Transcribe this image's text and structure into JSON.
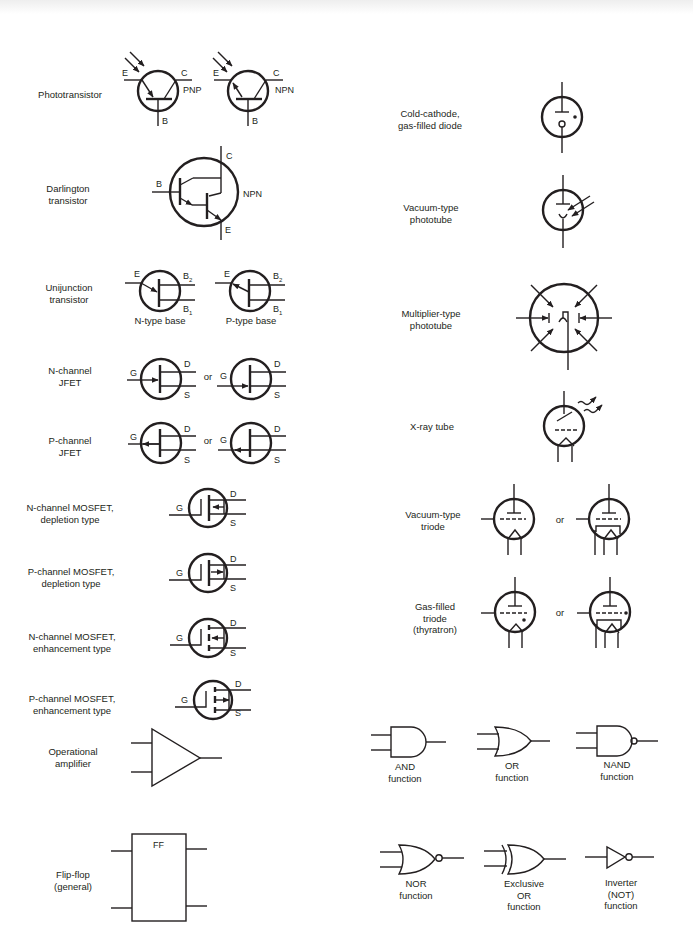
{
  "left_column": [
    {
      "id": "phototransistor",
      "label": "Phototransistor",
      "variants": [
        "PNP",
        "NPN"
      ],
      "pins": [
        "E",
        "C",
        "B"
      ]
    },
    {
      "id": "darlington",
      "label": "Darlington\ntransistor",
      "variants": [
        "NPN"
      ],
      "pins": [
        "B",
        "C",
        "E"
      ]
    },
    {
      "id": "ujt",
      "label": "Unijunction\ntransistor",
      "variants": [
        "N-type base",
        "P-type base"
      ],
      "pins": [
        "E",
        "B2",
        "B1"
      ]
    },
    {
      "id": "njfet",
      "label": "N-channel\nJFET",
      "pins": [
        "G",
        "D",
        "S"
      ],
      "or": "or"
    },
    {
      "id": "pjfet",
      "label": "P-channel\nJFET",
      "pins": [
        "G",
        "D",
        "S"
      ],
      "or": "or"
    },
    {
      "id": "nmos_dep",
      "label": "N-channel MOSFET,\ndepletion type",
      "pins": [
        "G",
        "D",
        "S"
      ]
    },
    {
      "id": "pmos_dep",
      "label": "P-channel MOSFET,\ndepletion type",
      "pins": [
        "G",
        "D",
        "S"
      ]
    },
    {
      "id": "nmos_enh",
      "label": "N-channel MOSFET,\nenhancement type",
      "pins": [
        "G",
        "D",
        "S"
      ]
    },
    {
      "id": "pmos_enh",
      "label": "P-channel MOSFET,\nenhancement type",
      "pins": [
        "G",
        "D",
        "S"
      ]
    },
    {
      "id": "opamp",
      "label": "Operational\namplifier"
    },
    {
      "id": "flipflop",
      "label": "Flip-flop\n(general)",
      "box_label": "FF"
    }
  ],
  "right_column": [
    {
      "id": "cold_cathode",
      "label": "Cold-cathode,\ngas-filled diode"
    },
    {
      "id": "vac_phototube",
      "label": "Vacuum-type\nphototube"
    },
    {
      "id": "mult_phototube",
      "label": "Multiplier-type\nphototube"
    },
    {
      "id": "xray",
      "label": "X-ray tube"
    },
    {
      "id": "vac_triode",
      "label": "Vacuum-type\ntriode",
      "or": "or"
    },
    {
      "id": "gas_triode",
      "label": "Gas-filled\ntriode\n(thyratron)",
      "or": "or"
    }
  ],
  "logic_gates": [
    {
      "id": "and",
      "label": "AND\nfunction"
    },
    {
      "id": "or",
      "label": "OR\nfunction"
    },
    {
      "id": "nand",
      "label": "NAND\nfunction"
    },
    {
      "id": "nor",
      "label": "NOR\nfunction"
    },
    {
      "id": "xor",
      "label": "Exclusive\nOR\nfunction"
    },
    {
      "id": "not",
      "label": "Inverter\n(NOT)\nfunction"
    }
  ],
  "labels": {
    "phototransistor": "Phototransistor",
    "darlington_1": "Darlington",
    "darlington_2": "transistor",
    "ujt_1": "Unijunction",
    "ujt_2": "transistor",
    "ujt_n": "N-type base",
    "ujt_p": "P-type base",
    "njfet_1": "N-channel",
    "njfet_2": "JFET",
    "pjfet_1": "P-channel",
    "pjfet_2": "JFET",
    "nmosd_1": "N-channel MOSFET,",
    "nmosd_2": "depletion type",
    "pmosd_1": "P-channel MOSFET,",
    "pmosd_2": "depletion type",
    "nmose_1": "N-channel MOSFET,",
    "nmose_2": "enhancement type",
    "pmose_1": "P-channel MOSFET,",
    "pmose_2": "enhancement type",
    "opamp_1": "Operational",
    "opamp_2": "amplifier",
    "ff_1": "Flip-flop",
    "ff_2": "(general)",
    "ff_box": "FF",
    "cc_1": "Cold-cathode,",
    "cc_2": "gas-filled diode",
    "vp_1": "Vacuum-type",
    "vp_2": "phototube",
    "mp_1": "Multiplier-type",
    "mp_2": "phototube",
    "xray": "X-ray tube",
    "vt_1": "Vacuum-type",
    "vt_2": "triode",
    "gt_1": "Gas-filled",
    "gt_2": "triode",
    "gt_3": "(thyratron)",
    "or": "or",
    "and_1": "AND",
    "or_1": "OR",
    "nand_1": "NAND",
    "nor_1": "NOR",
    "xor_1": "Exclusive",
    "xor_2": "OR",
    "not_1": "Inverter",
    "not_2": "(NOT)",
    "function": "function",
    "pin_E": "E",
    "pin_C": "C",
    "pin_B": "B",
    "pin_G": "G",
    "pin_D": "D",
    "pin_S": "S",
    "pin_B2": "B",
    "pin_B1": "B",
    "sub_2": "2",
    "sub_1": "1",
    "PNP": "PNP",
    "NPN": "NPN"
  }
}
